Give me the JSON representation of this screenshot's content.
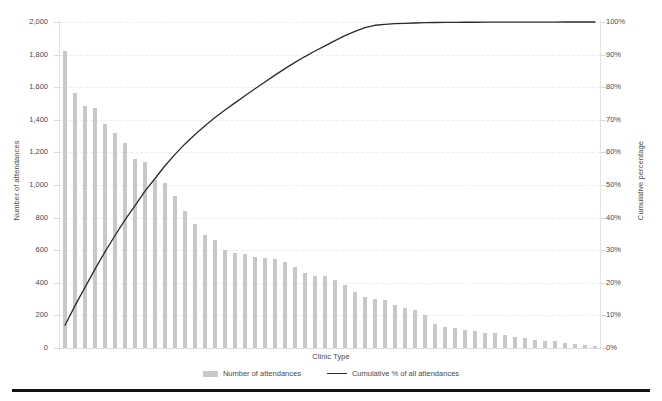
{
  "chart_data": {
    "type": "bar",
    "title": "",
    "subtitle": "",
    "xlabel": "Clinic Type",
    "ylabel": "Number of attendances",
    "y2label": "Cumulative percentage",
    "ylim": [
      0,
      2000
    ],
    "y2lim": [
      0,
      100
    ],
    "grid": true,
    "legend_position": "bottom",
    "yticks": [
      "0",
      "200",
      "400",
      "600",
      "800",
      "1,000",
      "1,200",
      "1,400",
      "1,600",
      "1,800",
      "2,000"
    ],
    "ytick_values": [
      0,
      200,
      400,
      600,
      800,
      1000,
      1200,
      1400,
      1600,
      1800,
      2000
    ],
    "y2ticks": [
      "0%",
      "10%",
      "20%",
      "30%",
      "40%",
      "50%",
      "60%",
      "70%",
      "80%",
      "90%",
      "100%"
    ],
    "y2tick_values": [
      0,
      10,
      20,
      30,
      40,
      50,
      60,
      70,
      80,
      90,
      100
    ],
    "categories": [
      "C1",
      "C2",
      "C3",
      "C4",
      "C5",
      "C6",
      "C7",
      "C8",
      "C9",
      "C10",
      "C11",
      "C12",
      "C13",
      "C14",
      "C15",
      "C16",
      "C17",
      "C18",
      "C19",
      "C20",
      "C21",
      "C22",
      "C23",
      "C24",
      "C25",
      "C26",
      "C27",
      "C28",
      "C29",
      "C30",
      "C31",
      "C32",
      "C33",
      "C34",
      "C35",
      "C36",
      "C37",
      "C38",
      "C39",
      "C40",
      "C41",
      "C42",
      "C43",
      "C44",
      "C45",
      "C46",
      "C47",
      "C48",
      "C49",
      "C50",
      "C51",
      "C52",
      "C53",
      "C54"
    ],
    "series": [
      {
        "name": "Number of attendances",
        "type": "bar",
        "axis": "left",
        "color": "#c8c8c8",
        "values": [
          1825,
          1565,
          1485,
          1470,
          1375,
          1320,
          1255,
          1160,
          1140,
          1030,
          1015,
          930,
          840,
          760,
          695,
          665,
          600,
          580,
          575,
          560,
          555,
          545,
          530,
          500,
          460,
          440,
          440,
          415,
          385,
          345,
          315,
          300,
          295,
          265,
          245,
          235,
          200,
          150,
          130,
          120,
          110,
          105,
          95,
          90,
          80,
          70,
          60,
          50,
          45,
          40,
          30,
          25,
          18,
          10
        ]
      },
      {
        "name": "Cumulative % of all attendances",
        "type": "line",
        "axis": "right",
        "color": "#2b2b2b",
        "values": [
          7.0,
          13.0,
          18.6,
          24.2,
          29.5,
          34.5,
          39.3,
          43.7,
          48.1,
          52.0,
          55.9,
          59.4,
          62.6,
          65.5,
          68.2,
          70.7,
          73.0,
          75.2,
          77.4,
          79.5,
          81.6,
          83.7,
          85.7,
          87.6,
          89.4,
          91.1,
          92.7,
          94.3,
          95.8,
          97.1,
          98.3,
          99.0,
          99.3,
          99.5,
          99.6,
          99.7,
          99.8,
          99.85,
          99.88,
          99.9,
          99.92,
          99.93,
          99.94,
          99.95,
          99.96,
          99.97,
          99.975,
          99.98,
          99.985,
          99.99,
          99.993,
          99.996,
          99.998,
          100.0
        ]
      }
    ]
  },
  "legend": {
    "items": [
      {
        "label": "Number of attendances",
        "marker": "bar-swatch-icon"
      },
      {
        "label": "Cumulative % of all attendances",
        "marker": "line-swatch-icon"
      }
    ]
  }
}
